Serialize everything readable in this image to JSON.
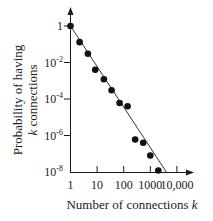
{
  "chart_data": {
    "type": "scatter",
    "title": "",
    "xlabel": "Number of connections k",
    "ylabel": "Probability of having k connections",
    "xscale": "log",
    "yscale": "log",
    "xlim": [
      1,
      10000
    ],
    "ylim": [
      1e-08,
      1
    ],
    "x_ticks": [
      "1",
      "10",
      "100",
      "1000",
      "10,000"
    ],
    "y_ticks": [
      "1",
      "10^-2",
      "10^-4",
      "10^-6",
      "10^-8"
    ],
    "grid": false,
    "legend": null,
    "series": [
      {
        "name": "observed",
        "style": "filled-circles",
        "x": [
          1,
          2.2,
          4.5,
          8.5,
          18,
          35,
          70,
          140,
          270,
          540,
          1000,
          2000
        ],
        "y": [
          1,
          0.13,
          0.03,
          0.004,
          0.0012,
          0.0003,
          6e-05,
          4e-05,
          6e-07,
          4e-07,
          8e-08,
          1.2e-08
        ]
      },
      {
        "name": "power-law fit",
        "style": "line",
        "x": [
          1,
          4000
        ],
        "y": [
          1,
          1e-08
        ]
      }
    ]
  },
  "axes": {
    "x_label_prefix": "Number of connections ",
    "x_label_var": "k",
    "y_label_line1": "Probability of having",
    "y_label_line2_var": "k",
    "y_label_line2_rest": " connections",
    "x_tick_labels": [
      "1",
      "10",
      "100",
      "1000",
      "10,000"
    ],
    "y_tick_base": [
      "1",
      "10",
      "10",
      "10",
      "10"
    ],
    "y_tick_exp": [
      "",
      "-2",
      "-4",
      "-6",
      "-8"
    ]
  }
}
